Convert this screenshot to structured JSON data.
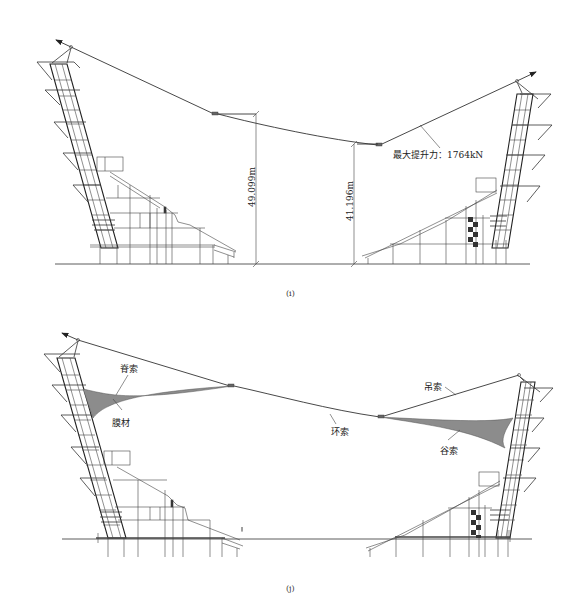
{
  "figure_i": {
    "caption": "(i)",
    "dimensions": [
      {
        "label": "49.099m",
        "side": "left"
      },
      {
        "label": "41.196m",
        "side": "right"
      }
    ],
    "annotation": "最大提升力：1764kN"
  },
  "figure_j": {
    "caption": "(j)",
    "labels": {
      "ridge_cable": "脊索",
      "membrane": "膜材",
      "ring_cable": "环索",
      "suspension_cable": "吊索",
      "valley_cable": "谷索"
    }
  },
  "colors": {
    "line": "#333333",
    "membrane": "#8c8c8c",
    "background": "#ffffff"
  }
}
